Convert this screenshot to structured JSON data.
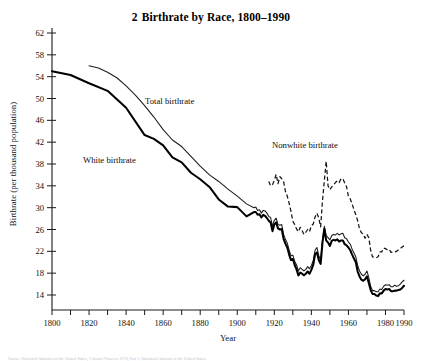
{
  "figure": {
    "number": "2",
    "title": "Birthrate by Race, 1800–1990",
    "full_title": "2  Birthrate by Race, 1800–1990",
    "footnote": "Source: Historical Statistics of the United States, Colonial Times to 1970, Part 1; Statistical Abstract of the United States."
  },
  "axes": {
    "ylabel": "Birthrate (per thousand population)",
    "xlabel": "Year",
    "yticks": [
      14,
      18,
      22,
      26,
      30,
      34,
      38,
      42,
      46,
      50,
      54,
      58,
      62
    ],
    "ylim": [
      12,
      64
    ],
    "xticks_major": [
      1800,
      1820,
      1840,
      1860,
      1880,
      1900,
      1920,
      1940,
      1960,
      1980,
      1990
    ],
    "xticks_minor": [
      1810,
      1830,
      1850,
      1870,
      1890,
      1910,
      1930,
      1950,
      1970
    ],
    "xlim": [
      1800,
      1990
    ],
    "grid": false
  },
  "annotations": [
    {
      "name": "total-birthrate-label",
      "text": "Total birthrate",
      "x": 145,
      "y": 104
    },
    {
      "name": "white-birthrate-label",
      "text": "White birthrate",
      "x": 83,
      "y": 163
    },
    {
      "name": "nonwhite-birthrate-label",
      "text": "Nonwhite birthrate",
      "x": 272,
      "y": 148
    }
  ],
  "chart_data": {
    "type": "line",
    "xlabel": "Year",
    "ylabel": "Birthrate (per thousand population)",
    "xlim": [
      1800,
      1990
    ],
    "ylim": [
      12,
      64
    ],
    "grid": false,
    "legend_position": "inline-annotations",
    "series": [
      {
        "name": "Total birthrate",
        "style": "thin-solid",
        "color": "#1b1b1b",
        "x": [
          1820,
          1825,
          1830,
          1835,
          1840,
          1845,
          1850,
          1855,
          1860,
          1865,
          1870,
          1875,
          1880,
          1885,
          1890,
          1895,
          1900,
          1905,
          1909,
          1910,
          1911,
          1912,
          1913,
          1914,
          1915,
          1916,
          1917,
          1918,
          1919,
          1920,
          1921,
          1922,
          1923,
          1924,
          1925,
          1926,
          1927,
          1928,
          1929,
          1930,
          1931,
          1932,
          1933,
          1934,
          1935,
          1936,
          1937,
          1938,
          1939,
          1940,
          1941,
          1942,
          1943,
          1944,
          1945,
          1946,
          1947,
          1948,
          1949,
          1950,
          1951,
          1952,
          1953,
          1954,
          1955,
          1956,
          1957,
          1958,
          1959,
          1960,
          1961,
          1962,
          1963,
          1964,
          1965,
          1966,
          1967,
          1968,
          1969,
          1970,
          1971,
          1972,
          1973,
          1974,
          1975,
          1976,
          1977,
          1978,
          1979,
          1980,
          1981,
          1982,
          1983,
          1984,
          1985,
          1986,
          1987,
          1988,
          1989,
          1990
        ],
        "y": [
          56.0,
          55.6,
          54.8,
          53.8,
          52.3,
          50.6,
          48.7,
          46.6,
          44.3,
          42.4,
          41.2,
          39.4,
          37.6,
          36.0,
          34.8,
          33.4,
          32.1,
          30.7,
          30.0,
          30.1,
          29.5,
          29.6,
          29.0,
          29.5,
          29.4,
          29.0,
          28.4,
          28.2,
          26.6,
          27.7,
          28.1,
          26.9,
          26.8,
          26.9,
          25.1,
          24.2,
          23.5,
          22.2,
          21.2,
          21.3,
          20.2,
          19.5,
          18.4,
          19.0,
          18.7,
          18.4,
          18.7,
          19.2,
          18.8,
          19.4,
          20.3,
          22.2,
          22.7,
          21.2,
          20.4,
          24.1,
          26.6,
          24.9,
          24.5,
          24.1,
          24.9,
          25.1,
          25.0,
          25.3,
          25.0,
          25.2,
          25.3,
          24.5,
          24.3,
          23.7,
          23.3,
          22.4,
          21.7,
          21.0,
          19.4,
          18.4,
          17.8,
          17.5,
          17.8,
          18.4,
          17.2,
          15.6,
          14.8,
          14.8,
          14.6,
          14.6,
          15.1,
          15.0,
          15.6,
          15.9,
          15.8,
          15.9,
          15.5,
          15.5,
          15.8,
          15.6,
          15.7,
          16.0,
          16.4,
          16.7
        ]
      },
      {
        "name": "White birthrate",
        "style": "thick-solid",
        "color": "#000000",
        "x": [
          1800,
          1810,
          1820,
          1830,
          1840,
          1850,
          1855,
          1860,
          1865,
          1870,
          1875,
          1880,
          1885,
          1890,
          1895,
          1900,
          1905,
          1909,
          1910,
          1911,
          1912,
          1913,
          1914,
          1915,
          1916,
          1917,
          1918,
          1919,
          1920,
          1921,
          1922,
          1923,
          1924,
          1925,
          1926,
          1927,
          1928,
          1929,
          1930,
          1931,
          1932,
          1933,
          1934,
          1935,
          1936,
          1937,
          1938,
          1939,
          1940,
          1941,
          1942,
          1943,
          1944,
          1945,
          1946,
          1947,
          1948,
          1949,
          1950,
          1951,
          1952,
          1953,
          1954,
          1955,
          1956,
          1957,
          1958,
          1959,
          1960,
          1961,
          1962,
          1963,
          1964,
          1965,
          1966,
          1967,
          1968,
          1969,
          1970,
          1971,
          1972,
          1973,
          1974,
          1975,
          1976,
          1977,
          1978,
          1979,
          1980,
          1981,
          1982,
          1983,
          1984,
          1985,
          1986,
          1987,
          1988,
          1989,
          1990
        ],
        "y": [
          55.0,
          54.3,
          52.8,
          51.4,
          48.3,
          43.3,
          42.6,
          41.4,
          39.2,
          38.3,
          36.4,
          35.2,
          33.8,
          31.5,
          30.2,
          30.1,
          28.4,
          29.2,
          29.2,
          28.7,
          28.8,
          28.2,
          28.7,
          28.5,
          28.1,
          27.6,
          27.3,
          25.7,
          26.9,
          27.3,
          26.2,
          26.0,
          26.1,
          24.3,
          23.4,
          22.7,
          21.4,
          20.4,
          20.6,
          19.5,
          18.7,
          17.6,
          18.1,
          17.9,
          17.6,
          17.9,
          18.3,
          17.9,
          18.6,
          19.5,
          21.5,
          21.8,
          20.4,
          19.7,
          23.6,
          26.1,
          24.0,
          23.6,
          23.0,
          23.9,
          24.1,
          24.0,
          24.2,
          23.8,
          24.0,
          24.0,
          23.3,
          23.1,
          22.7,
          22.2,
          21.4,
          20.7,
          20.0,
          18.3,
          17.4,
          16.8,
          16.6,
          16.9,
          17.4,
          16.2,
          14.9,
          14.2,
          14.2,
          13.9,
          13.8,
          14.3,
          14.3,
          14.8,
          15.1,
          15.0,
          15.1,
          14.7,
          14.7,
          14.8,
          14.8,
          14.9,
          15.0,
          15.3,
          15.7
        ]
      },
      {
        "name": "Nonwhite birthrate",
        "style": "dashed",
        "color": "#141414",
        "x": [
          1917,
          1918,
          1919,
          1920,
          1921,
          1922,
          1923,
          1924,
          1925,
          1926,
          1927,
          1928,
          1929,
          1930,
          1931,
          1932,
          1933,
          1934,
          1935,
          1936,
          1937,
          1938,
          1939,
          1940,
          1941,
          1942,
          1943,
          1944,
          1945,
          1946,
          1947,
          1948,
          1949,
          1950,
          1951,
          1952,
          1953,
          1954,
          1955,
          1956,
          1957,
          1958,
          1959,
          1960,
          1961,
          1962,
          1963,
          1964,
          1965,
          1966,
          1967,
          1968,
          1969,
          1970,
          1971,
          1972,
          1973,
          1974,
          1975,
          1976,
          1977,
          1978,
          1979,
          1980,
          1981,
          1982,
          1983,
          1984,
          1985,
          1986,
          1987,
          1988,
          1989,
          1990
        ],
        "y": [
          34.8,
          34.0,
          34.2,
          35.0,
          36.1,
          34.4,
          35.7,
          35.3,
          34.8,
          33.0,
          32.1,
          30.8,
          29.3,
          27.5,
          26.9,
          26.1,
          25.6,
          26.4,
          25.8,
          25.1,
          25.5,
          26.0,
          25.6,
          26.7,
          27.0,
          28.3,
          29.0,
          28.1,
          26.5,
          31.2,
          35.0,
          38.5,
          34.0,
          33.3,
          33.8,
          34.2,
          34.6,
          34.9,
          34.6,
          35.3,
          35.3,
          34.5,
          33.8,
          32.1,
          31.6,
          30.7,
          29.6,
          28.7,
          27.6,
          26.1,
          25.4,
          25.2,
          24.4,
          25.1,
          24.5,
          22.2,
          21.0,
          20.9,
          20.8,
          21.0,
          21.9,
          21.9,
          22.6,
          22.5,
          22.3,
          22.4,
          21.8,
          21.9,
          21.9,
          22.0,
          22.3,
          22.5,
          22.8,
          23.0
        ]
      }
    ]
  }
}
